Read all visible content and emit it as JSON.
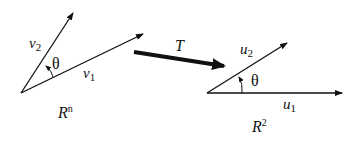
{
  "diagram": {
    "left_space": {
      "label_base": "R",
      "label_sup": "n",
      "vectors": [
        {
          "name": "v",
          "sub": "2"
        },
        {
          "name": "v",
          "sub": "1"
        }
      ],
      "angle_label": "θ"
    },
    "transformation": {
      "label": "T"
    },
    "right_space": {
      "label_base": "R",
      "label_sup": "2",
      "vectors": [
        {
          "name": "u",
          "sub": "2"
        },
        {
          "name": "u",
          "sub": "1"
        }
      ],
      "angle_label": "θ"
    },
    "colors": {
      "ink": "#111111",
      "background": "#ffffff"
    }
  }
}
